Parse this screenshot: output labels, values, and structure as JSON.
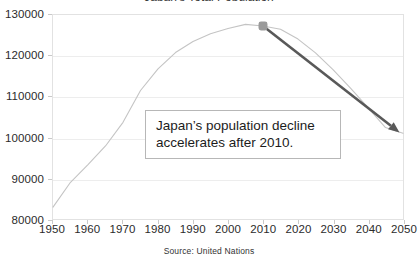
{
  "chart_data": {
    "type": "line",
    "title": "Japan's Total Population",
    "xlabel": "",
    "ylabel": "",
    "xlim": [
      1950,
      2050
    ],
    "ylim": [
      80000,
      130000
    ],
    "grid": true,
    "legend": false,
    "source": "Source: United Nations",
    "x_ticks": [
      "1950",
      "1960",
      "1970",
      "1980",
      "1990",
      "2000",
      "2010",
      "2020",
      "2030",
      "2040",
      "2050"
    ],
    "y_ticks": [
      "80000",
      "90000",
      "100000",
      "110000",
      "120000",
      "130000"
    ],
    "series": [
      {
        "name": "Japan population (thousands)",
        "color": "#c4c4c4",
        "x": [
          1950,
          1955,
          1960,
          1965,
          1970,
          1975,
          1980,
          1985,
          1990,
          1995,
          2000,
          2005,
          2010,
          2015,
          2020,
          2025,
          2030,
          2035,
          2040,
          2045,
          2050
        ],
        "values": [
          82900,
          89000,
          93300,
          97900,
          103700,
          111500,
          116800,
          120800,
          123500,
          125400,
          126700,
          127700,
          127300,
          126500,
          124100,
          120700,
          116600,
          112100,
          107300,
          102400,
          101000
        ]
      }
    ],
    "marker": {
      "name": "peak-marker",
      "x": 2010,
      "y": 127300,
      "color": "#9a9a9a",
      "shape": "rounded-square"
    },
    "arrow": {
      "name": "decline-arrow",
      "color": "#595959",
      "from_x": 2010,
      "from_y": 127300,
      "to_x": 2049,
      "to_y": 101200
    },
    "annotation": {
      "lines": [
        "Japan’s population decline",
        "accelerates after 2010."
      ]
    }
  }
}
